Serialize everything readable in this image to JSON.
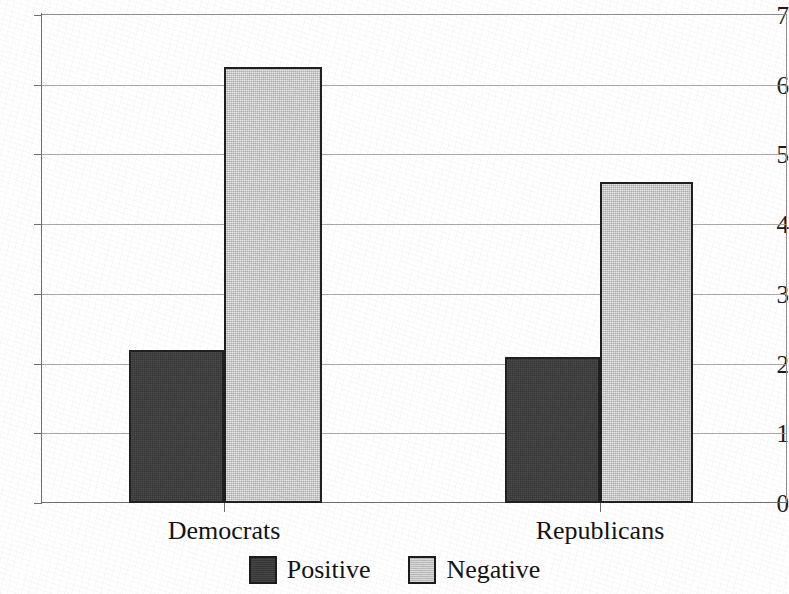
{
  "chart_data": {
    "type": "bar",
    "title": "",
    "subtitle": "",
    "xlabel": "",
    "ylabel": "",
    "categories": [
      "Democrats",
      "Republicans"
    ],
    "series": [
      {
        "name": "Positive",
        "color": "#3b3b3b",
        "values": [
          2.2,
          2.1
        ]
      },
      {
        "name": "Negative",
        "color": "#c9c9c9",
        "values": [
          6.25,
          4.6
        ]
      }
    ],
    "ylim": [
      0,
      7
    ],
    "ytick_labels": [
      "0",
      "1",
      "2",
      "3",
      "4",
      "5",
      "6",
      "7"
    ],
    "ytick_values": [
      0,
      1,
      2,
      3,
      4,
      5,
      6,
      7
    ],
    "grid": true,
    "grid_axis": "y",
    "legend_position": "bottom",
    "bar_gap": 0,
    "annotations": []
  },
  "legend": {
    "entries": [
      {
        "label": "Positive",
        "swatch": "positive-swatch"
      },
      {
        "label": "Negative",
        "swatch": "negative-swatch"
      }
    ]
  },
  "axis": {
    "y_ticks": [
      {
        "label": "7",
        "value": 7
      },
      {
        "label": "6",
        "value": 6
      },
      {
        "label": "5",
        "value": 5
      },
      {
        "label": "4",
        "value": 4
      },
      {
        "label": "3",
        "value": 3
      },
      {
        "label": "2",
        "value": 2
      },
      {
        "label": "1",
        "value": 1
      },
      {
        "label": "0",
        "value": 0
      }
    ],
    "x_ticks": [
      {
        "label": "Democrats"
      },
      {
        "label": "Republicans"
      }
    ]
  },
  "colors": {
    "positive": "#3b3b3b",
    "negative": "#c9c9c9",
    "gridline": "#9a9a9a",
    "axis": "#6e6e6e",
    "bar_outline": "#202020",
    "background": "#ffffff",
    "text": "#141414"
  }
}
